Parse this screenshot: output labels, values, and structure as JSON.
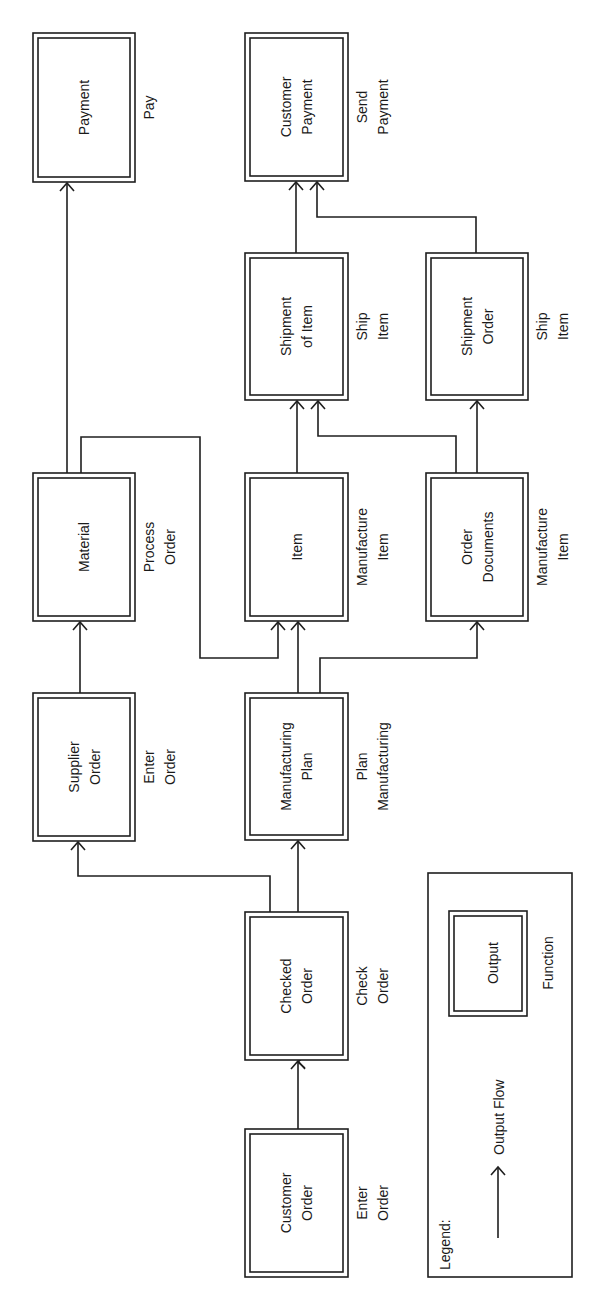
{
  "diagram": {
    "orientation": "rotated-90-ccw",
    "colors": {
      "stroke": "#1f1f1f",
      "text": "#1a1a1a",
      "background": "#ffffff"
    },
    "nodes": [
      {
        "id": "payment",
        "output": [
          "Payment"
        ],
        "function": [
          "Pay"
        ]
      },
      {
        "id": "material",
        "output": [
          "Material"
        ],
        "function": [
          "Process",
          "Order"
        ]
      },
      {
        "id": "supplier_order",
        "output": [
          "Supplier",
          "Order"
        ],
        "function": [
          "Enter",
          "Order"
        ]
      },
      {
        "id": "customer_payment",
        "output": [
          "Customer",
          "Payment"
        ],
        "function": [
          "Send",
          "Payment"
        ]
      },
      {
        "id": "shipment_of_item",
        "output": [
          "Shipment",
          "of Item"
        ],
        "function": [
          "Ship",
          "Item"
        ]
      },
      {
        "id": "item",
        "output": [
          "Item"
        ],
        "function": [
          "Manufacture",
          "Item"
        ]
      },
      {
        "id": "manufacturing_plan",
        "output": [
          "Manufacturing",
          "Plan"
        ],
        "function": [
          "Plan",
          "Manufacturing"
        ]
      },
      {
        "id": "checked_order",
        "output": [
          "Checked",
          "Order"
        ],
        "function": [
          "Check",
          "Order"
        ]
      },
      {
        "id": "customer_order",
        "output": [
          "Customer",
          "Order"
        ],
        "function": [
          "Enter",
          "Order"
        ]
      },
      {
        "id": "shipment_order",
        "output": [
          "Shipment",
          "Order"
        ],
        "function": [
          "Ship",
          "Item"
        ]
      },
      {
        "id": "order_documents",
        "output": [
          "Order",
          "Documents"
        ],
        "function": [
          "Manufacture",
          "Item"
        ]
      }
    ],
    "edges": [
      {
        "from": "customer_order",
        "to": "checked_order"
      },
      {
        "from": "checked_order",
        "to": "supplier_order"
      },
      {
        "from": "checked_order",
        "to": "manufacturing_plan"
      },
      {
        "from": "supplier_order",
        "to": "material"
      },
      {
        "from": "material",
        "to": "payment"
      },
      {
        "from": "material",
        "to": "item"
      },
      {
        "from": "manufacturing_plan",
        "to": "item"
      },
      {
        "from": "manufacturing_plan",
        "to": "order_documents"
      },
      {
        "from": "item",
        "to": "shipment_of_item"
      },
      {
        "from": "order_documents",
        "to": "shipment_of_item"
      },
      {
        "from": "order_documents",
        "to": "shipment_order"
      },
      {
        "from": "shipment_of_item",
        "to": "customer_payment"
      },
      {
        "from": "shipment_order",
        "to": "customer_payment"
      }
    ]
  },
  "legend": {
    "title": "Legend:",
    "arrow_label": "Output Flow",
    "box_label": "Output",
    "function_label": "Function"
  }
}
